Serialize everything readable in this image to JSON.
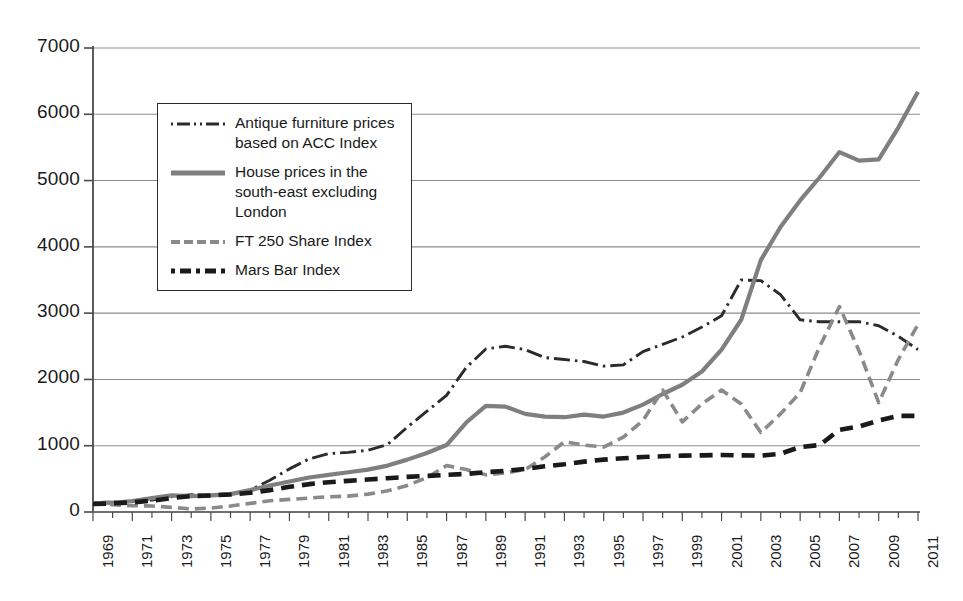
{
  "chart_data": {
    "type": "line",
    "title": "",
    "subtitle": "",
    "xlabel": "",
    "ylabel": "",
    "xlim": [
      1969,
      2011
    ],
    "ylim": [
      0,
      7000
    ],
    "grid": true,
    "legend_position": "upper-left inside",
    "y_ticks": [
      0,
      1000,
      2000,
      3000,
      4000,
      5000,
      6000,
      7000
    ],
    "x_ticks": [
      1969,
      1971,
      1973,
      1975,
      1977,
      1979,
      1981,
      1983,
      1985,
      1987,
      1989,
      1991,
      1993,
      1995,
      1997,
      1999,
      2001,
      2003,
      2005,
      2007,
      2009,
      2011
    ],
    "x": [
      1969,
      1970,
      1971,
      1972,
      1973,
      1974,
      1975,
      1976,
      1977,
      1978,
      1979,
      1980,
      1981,
      1982,
      1983,
      1984,
      1985,
      1986,
      1987,
      1988,
      1989,
      1990,
      1991,
      1992,
      1993,
      1994,
      1995,
      1996,
      1997,
      1998,
      1999,
      2000,
      2001,
      2002,
      2003,
      2004,
      2005,
      2006,
      2007,
      2008,
      2009,
      2010,
      2011
    ],
    "series": [
      {
        "name": "Antique furniture prices based on ACC Index",
        "style": "dash-dot",
        "color": "#2b2b2b",
        "values": [
          140,
          150,
          160,
          180,
          230,
          260,
          250,
          270,
          330,
          480,
          650,
          800,
          880,
          900,
          930,
          1020,
          1280,
          1520,
          1760,
          2180,
          2460,
          2500,
          2450,
          2330,
          2300,
          2270,
          2200,
          2220,
          2420,
          2530,
          2640,
          2790,
          2960,
          3500,
          3490,
          3280,
          2900,
          2870,
          2870,
          2870,
          2810,
          2650,
          2450
        ]
      },
      {
        "name": "House prices in the south-east excluding London",
        "style": "solid",
        "color": "#7f7f7f",
        "values": [
          130,
          140,
          165,
          210,
          250,
          240,
          250,
          270,
          330,
          400,
          460,
          520,
          560,
          600,
          640,
          700,
          790,
          890,
          1010,
          1350,
          1600,
          1590,
          1480,
          1440,
          1430,
          1470,
          1440,
          1500,
          1620,
          1780,
          1920,
          2120,
          2450,
          2900,
          3800,
          4300,
          4700,
          5050,
          5430,
          5300,
          5320,
          5800,
          6340
        ]
      },
      {
        "name": "FT 250 Share Index",
        "style": "dashed-medium",
        "color": "#8a8a8a",
        "values": [
          130,
          110,
          95,
          90,
          70,
          45,
          60,
          90,
          130,
          170,
          190,
          210,
          230,
          240,
          270,
          320,
          400,
          520,
          700,
          640,
          560,
          590,
          640,
          830,
          1060,
          1010,
          980,
          1130,
          1380,
          1840,
          1360,
          1630,
          1840,
          1630,
          1200,
          1480,
          1800,
          2500,
          3100,
          2430,
          1650,
          2300,
          2830
        ]
      },
      {
        "name": "Mars Bar Index",
        "style": "dashed-bold",
        "color": "#1a1a1a",
        "values": [
          120,
          130,
          145,
          170,
          210,
          240,
          250,
          265,
          290,
          330,
          380,
          420,
          450,
          470,
          490,
          510,
          530,
          545,
          560,
          575,
          600,
          620,
          650,
          690,
          720,
          760,
          790,
          810,
          830,
          840,
          850,
          855,
          860,
          855,
          850,
          880,
          980,
          1010,
          1240,
          1290,
          1380,
          1450,
          1450
        ]
      }
    ]
  },
  "legend": {
    "items": [
      {
        "label": "Antique furniture prices based on ACC Index",
        "style": "dash-dot"
      },
      {
        "label": "House prices in the south-east excluding London",
        "style": "solid"
      },
      {
        "label": "FT 250 Share Index",
        "style": "dashed-medium"
      },
      {
        "label": "Mars Bar Index",
        "style": "dashed-bold"
      }
    ]
  },
  "axes": {
    "y_tick_labels": [
      "7000",
      "6000",
      "5000",
      "4000",
      "3000",
      "2000",
      "1000",
      "0"
    ],
    "x_tick_labels": [
      "1969",
      "1971",
      "1973",
      "1975",
      "1977",
      "1979",
      "1981",
      "1983",
      "1985",
      "1987",
      "1989",
      "1991",
      "1993",
      "1995",
      "1997",
      "1999",
      "2001",
      "2003",
      "2005",
      "2007",
      "2009",
      "2011"
    ]
  },
  "colors": {
    "gridline": "#8c8c8c",
    "axis": "#555555",
    "antique": "#2b2b2b",
    "house": "#7f7f7f",
    "ft250": "#8a8a8a",
    "mars": "#1a1a1a",
    "background": "#ffffff"
  }
}
